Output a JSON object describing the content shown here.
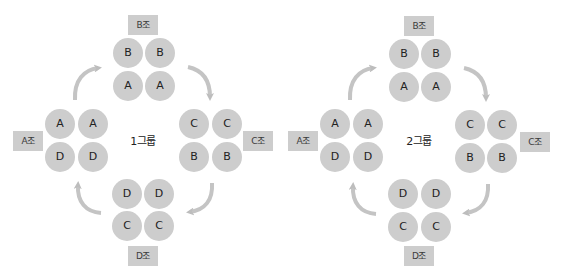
{
  "colors": {
    "background": "#ffffff",
    "seat_fill": "#cdcdcd",
    "label_fill": "#cdcdcd",
    "arrow": "#bdbdbd",
    "text": "#222222"
  },
  "diagrams": [
    {
      "title": "1그룹",
      "offset_x": 0,
      "teams": {
        "top": {
          "label": "B조",
          "seats": [
            [
              "B",
              "B"
            ],
            [
              "A",
              "A"
            ]
          ]
        },
        "left": {
          "label": "A조",
          "seats": [
            [
              "A",
              "A"
            ],
            [
              "D",
              "D"
            ]
          ]
        },
        "right": {
          "label": "C조",
          "seats": [
            [
              "C",
              "C"
            ],
            [
              "B",
              "B"
            ]
          ]
        },
        "bottom": {
          "label": "D조",
          "seats": [
            [
              "D",
              "D"
            ],
            [
              "C",
              "C"
            ]
          ]
        }
      }
    },
    {
      "title": "2그룹",
      "offset_x": 276,
      "teams": {
        "top": {
          "label": "B조",
          "seats": [
            [
              "B",
              "B"
            ],
            [
              "A",
              "A"
            ]
          ]
        },
        "left": {
          "label": "A조",
          "seats": [
            [
              "A",
              "A"
            ],
            [
              "D",
              "D"
            ]
          ]
        },
        "right": {
          "label": "C조",
          "seats": [
            [
              "C",
              "C"
            ],
            [
              "B",
              "B"
            ]
          ]
        },
        "bottom": {
          "label": "D조",
          "seats": [
            [
              "D",
              "D"
            ],
            [
              "C",
              "C"
            ]
          ]
        }
      }
    }
  ],
  "rotation": {
    "direction": "clockwise",
    "arrows": [
      "left-to-top",
      "top-to-right",
      "right-to-bottom",
      "bottom-to-left"
    ]
  }
}
